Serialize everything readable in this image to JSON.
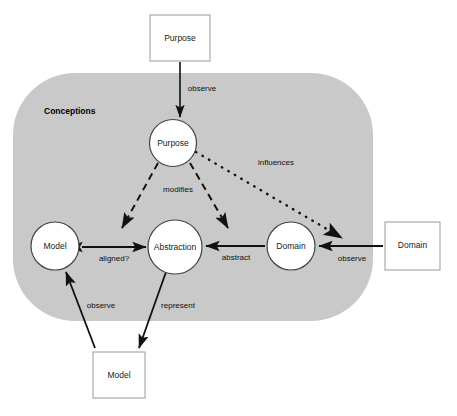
{
  "canvas": {
    "width": 457,
    "height": 416,
    "background": "#ffffff"
  },
  "region": {
    "name": "conceptions-region",
    "label": "Conceptions",
    "fill": "#c9c9c9",
    "x": 13,
    "y": 73,
    "width": 360,
    "height": 248,
    "radius": 62,
    "label_x": 44,
    "label_y": 112
  },
  "circles": [
    {
      "id": "purpose",
      "label": "Purpose",
      "cx": 173,
      "cy": 143,
      "r": 23.5,
      "fill": "#ffffff",
      "stroke": "#444444"
    },
    {
      "id": "model",
      "label": "Model",
      "cx": 55,
      "cy": 246,
      "r": 24,
      "fill": "#ffffff",
      "stroke": "#444444"
    },
    {
      "id": "abstraction",
      "label": "Abstraction",
      "cx": 175,
      "cy": 247,
      "r": 27,
      "fill": "#ffffff",
      "stroke": "#444444"
    },
    {
      "id": "domain",
      "label": "Domain",
      "cx": 291,
      "cy": 246,
      "r": 24,
      "fill": "#ffffff",
      "stroke": "#444444"
    }
  ],
  "boxes": [
    {
      "id": "purpose-box",
      "label": "Purpose",
      "x": 150,
      "y": 15,
      "width": 60,
      "height": 46,
      "fill": "#ffffff",
      "stroke": "#9a9a9a"
    },
    {
      "id": "model-box",
      "label": "Model",
      "x": 93,
      "y": 352,
      "width": 52,
      "height": 46,
      "fill": "#ffffff",
      "stroke": "#9a9a9a"
    },
    {
      "id": "domain-box",
      "label": "Domain",
      "x": 385,
      "y": 222,
      "width": 55,
      "height": 48,
      "fill": "#ffffff",
      "stroke": "#9a9a9a"
    }
  ],
  "edges": [
    {
      "id": "observe-purpose",
      "label": "observe",
      "style": "solid",
      "from": "purpose-box",
      "to": "purpose-circle",
      "path": "M 180,62 L 180,117",
      "label_x": 202,
      "label_y": 89,
      "arrow_end": true,
      "arrow_start": false
    },
    {
      "id": "modifies-model",
      "label": "modifies",
      "style": "dashed",
      "from": "purpose-circle",
      "to": "model-abstraction-left",
      "path": "M 158,163 L 122,228",
      "label_x": 178,
      "label_y": 190,
      "arrow_end": true,
      "arrow_start": false
    },
    {
      "id": "modifies-abstraction",
      "label": "",
      "style": "dashed",
      "from": "purpose-circle",
      "to": "abstraction-right",
      "path": "M 190,163 L 228,228",
      "label_x": 0,
      "label_y": 0,
      "arrow_end": true,
      "arrow_start": false
    },
    {
      "id": "influences",
      "label": "influences",
      "style": "dotted",
      "from": "purpose-circle",
      "to": "domain-observe",
      "path": "M 196,152 L 342,238",
      "label_x": 276,
      "label_y": 163,
      "arrow_end": true,
      "arrow_start": false
    },
    {
      "id": "aligned",
      "label": "aligned?",
      "style": "solid",
      "from": "abstraction",
      "to": "model",
      "path": "M 82,247 L 146,247",
      "label_x": 114,
      "label_y": 259,
      "arrow_end": true,
      "arrow_start": true
    },
    {
      "id": "abstract",
      "label": "abstract",
      "style": "solid",
      "from": "domain",
      "to": "abstraction",
      "path": "M 265,246 L 206,246",
      "label_x": 236,
      "label_y": 258,
      "arrow_end": true,
      "arrow_start": false
    },
    {
      "id": "observe-domain",
      "label": "observe",
      "style": "solid",
      "from": "domain-box",
      "to": "domain-circle",
      "path": "M 383,246 L 319,246",
      "label_x": 352,
      "label_y": 259,
      "arrow_end": true,
      "arrow_start": false
    },
    {
      "id": "observe-model",
      "label": "observe",
      "style": "solid",
      "from": "model-box",
      "to": "model-circle",
      "path": "M 95,348 L 66,272",
      "label_x": 101,
      "label_y": 306,
      "arrow_end": true,
      "arrow_start": false
    },
    {
      "id": "represent",
      "label": "represent",
      "style": "solid",
      "from": "abstraction",
      "to": "model-box",
      "path": "M 166,272 L 139,348",
      "label_x": 178,
      "label_y": 306,
      "arrow_end": true,
      "arrow_start": false
    }
  ]
}
